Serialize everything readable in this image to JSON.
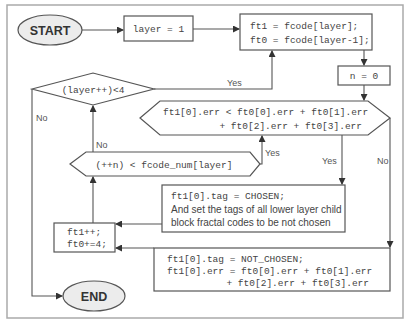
{
  "diagram": {
    "nodes": {
      "start": {
        "label": "START"
      },
      "init_layer": {
        "label": "layer = 1"
      },
      "assign_ft": {
        "line1": "ft1 = fcode[layer];",
        "line2": "ft0 = fcode[layer-1];"
      },
      "init_n": {
        "label": "n = 0"
      },
      "cmp_err": {
        "line1": "ft1[0].err < ft0[0].err + ft0[1].err",
        "line2": "+ ft0[2].err + ft0[3].err"
      },
      "layer_check": {
        "label": "(layer++)<4"
      },
      "n_check": {
        "label": "(++n) < fcode_num[layer]"
      },
      "chosen": {
        "line1": "ft1[0].tag = CHOSEN;",
        "line2": "And set the tags of all lower layer child",
        "line3": "block fractal codes to be not chosen"
      },
      "increment": {
        "line1": "ft1++;",
        "line2": "ft0+=4;"
      },
      "not_chosen": {
        "line1": "ft1[0].tag = NOT_CHOSEN;",
        "line2": "ft1[0].err = ft0[0].err + ft0[1].err",
        "line3": "+ ft0[2].err + ft0[3].err"
      },
      "end": {
        "label": "END"
      }
    },
    "edge_labels": {
      "layer_yes": "Yes",
      "layer_no": "No",
      "n_yes": "Yes",
      "n_no": "No",
      "cmp_yes": "Yes",
      "cmp_no": "No"
    }
  }
}
